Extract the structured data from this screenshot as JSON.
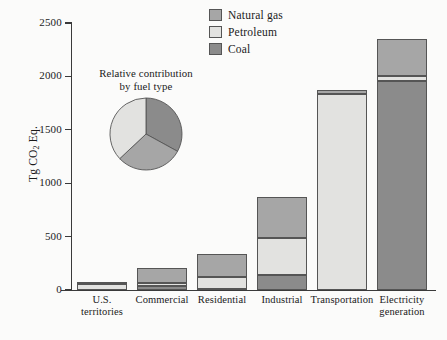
{
  "chart_data": {
    "type": "bar",
    "subtype": "stacked-bar",
    "title": "",
    "xlabel": "",
    "ylabel": "Tg CO2 Eq.",
    "ylabel_display": "Tg CO",
    "ylabel_sub": "2",
    "ylabel_tail": " Eq.",
    "ylim": [
      0,
      2500
    ],
    "yticks": [
      0,
      500,
      1000,
      1500,
      2000,
      2500
    ],
    "ytick_labels": [
      "0",
      "500",
      "1000",
      "1500",
      "2000",
      "2500"
    ],
    "grid": false,
    "legend_position": "top-center",
    "categories": [
      "U.S. territories",
      "Commercial",
      "Residential",
      "Industrial",
      "Transportation",
      "Electricity generation"
    ],
    "category_lines": [
      [
        "U.S.",
        "territories"
      ],
      [
        "Commercial"
      ],
      [
        "Residential"
      ],
      [
        "Industrial"
      ],
      [
        "Transportation"
      ],
      [
        "Electricity",
        "generation"
      ]
    ],
    "series": [
      {
        "name": "Coal",
        "color": "#8b8b8b",
        "values": [
          0,
          35,
          10,
          140,
          0,
          1960
        ]
      },
      {
        "name": "Petroleum",
        "color": "#e2e2e0",
        "values": [
          55,
          35,
          115,
          350,
          1840,
          45
        ]
      },
      {
        "name": "Natural gas",
        "color": "#a6a6a6",
        "values": [
          10,
          140,
          215,
          380,
          30,
          345
        ]
      }
    ],
    "stack_order_bottom_to_top": [
      "Coal",
      "Petroleum",
      "Natural gas"
    ],
    "totals": [
      65,
      210,
      340,
      870,
      1870,
      2350
    ],
    "legend_entries": [
      "Natural gas",
      "Petroleum",
      "Coal"
    ],
    "inset_pie": {
      "title_lines": [
        "Relative contribution",
        "by fuel type"
      ],
      "type": "pie",
      "labels": [
        "Coal",
        "Natural gas",
        "Petroleum"
      ],
      "values": [
        33,
        30,
        37
      ],
      "colors": [
        "#8b8b8b",
        "#a6a6a6",
        "#e2e2e0"
      ]
    },
    "colors": {
      "natural_gas": "#a6a6a6",
      "petroleum": "#e2e2e0",
      "coal": "#8b8b8b",
      "outline": "#555555",
      "axis": "#3a3a3a",
      "background": "#fbfbfa"
    }
  }
}
